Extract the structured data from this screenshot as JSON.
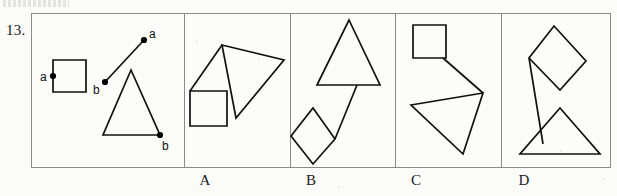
{
  "page": {
    "question_number": "13.",
    "top_cut_text": "",
    "canvas": {
      "width": 617,
      "height": 196
    }
  },
  "strip": {
    "x": 31,
    "y": 13,
    "width": 580,
    "height": 155,
    "border_color": "#8a8a86",
    "background_color": "#fcfcfa",
    "ink_color": "#111111",
    "dividers": [
      152,
      258,
      363,
      469
    ]
  },
  "cells": [
    {
      "name": "prompt-cell",
      "label": "",
      "x": 0,
      "width": 152,
      "shapes": [
        {
          "name": "prompt-square",
          "type": "polygon",
          "points": "21,46 54,46 54,78 21,78"
        },
        {
          "name": "prompt-triangle",
          "type": "polygon",
          "points": "99,56 128,121 71,121"
        },
        {
          "name": "prompt-segment",
          "type": "polyline",
          "points": "73,68 112,26"
        }
      ],
      "points": [
        {
          "name": "point-a-on-square",
          "label": "a",
          "x": 21,
          "y": 62,
          "label_dx": -13,
          "label_dy": 5
        },
        {
          "name": "point-a-on-segment",
          "label": "a",
          "x": 112,
          "y": 26,
          "label_dx": 5,
          "label_dy": -2
        },
        {
          "name": "point-b-on-segment",
          "label": "b",
          "x": 73,
          "y": 68,
          "label_dx": -12,
          "label_dy": 12
        },
        {
          "name": "point-b-on-triangle",
          "label": "b",
          "x": 128,
          "y": 121,
          "label_dx": 2,
          "label_dy": 15
        }
      ]
    },
    {
      "name": "option-cell-a",
      "label": "A",
      "x": 153,
      "width": 105,
      "shapes": [
        {
          "name": "option-a-square",
          "type": "polygon",
          "points": "5,77 42,77 42,112 5,112"
        },
        {
          "name": "option-a-triangle",
          "type": "polygon",
          "points": "37,31 99,46 51,104"
        },
        {
          "name": "option-a-segment",
          "type": "polyline",
          "points": "5,77 37,31"
        }
      ],
      "points": []
    },
    {
      "name": "option-cell-b",
      "label": "B",
      "x": 259,
      "width": 105,
      "shapes": [
        {
          "name": "option-b-triangle",
          "type": "polygon",
          "points": "58,6 89,71 26,71"
        },
        {
          "name": "option-b-diamond",
          "type": "polygon",
          "points": "22,94 44,125 22,150 0,122"
        },
        {
          "name": "option-b-segment",
          "type": "polyline",
          "points": "44,125 66,71"
        }
      ],
      "points": []
    },
    {
      "name": "option-cell-c",
      "label": "C",
      "x": 364,
      "width": 105,
      "shapes": [
        {
          "name": "option-c-square",
          "type": "polygon",
          "points": "17,11 50,11 50,44 17,44"
        },
        {
          "name": "option-c-triangle",
          "type": "polygon",
          "points": "87,79 15,91 67,140"
        },
        {
          "name": "option-c-segment",
          "type": "polyline",
          "points": "47,44 87,79"
        }
      ],
      "points": []
    },
    {
      "name": "option-cell-d",
      "label": "D",
      "x": 470,
      "width": 110,
      "shapes": [
        {
          "name": "option-d-diamond",
          "type": "polygon",
          "points": "52,12 84,47 58,76 27,44"
        },
        {
          "name": "option-d-triangle",
          "type": "polygon",
          "points": "58,94 98,140 18,140"
        },
        {
          "name": "option-d-segment",
          "type": "polyline",
          "points": "27,44 41,130"
        }
      ],
      "points": []
    }
  ],
  "option_letters": [
    {
      "label": "A",
      "center_x": 205
    },
    {
      "label": "B",
      "center_x": 311
    },
    {
      "label": "C",
      "center_x": 416
    },
    {
      "label": "D",
      "center_x": 524
    }
  ]
}
